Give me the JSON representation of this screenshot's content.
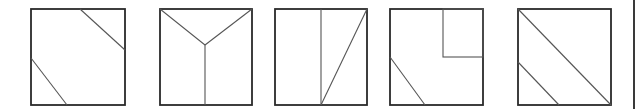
{
  "figure": {
    "stroke_color": "#2a2a2a",
    "inner_stroke_color": "#555555",
    "background": "#ffffff"
  },
  "squares": [
    {
      "id": "square-1",
      "frame": {
        "x": 31,
        "y": 9,
        "w": 94,
        "h": 96
      },
      "lines": [
        {
          "x1": 80,
          "y1": 9,
          "x2": 125,
          "y2": 50
        },
        {
          "x1": 31,
          "y1": 58,
          "x2": 67,
          "y2": 105
        }
      ],
      "rects": []
    },
    {
      "id": "square-2",
      "frame": {
        "x": 160,
        "y": 9,
        "w": 92,
        "h": 96
      },
      "lines": [
        {
          "x1": 160,
          "y1": 9,
          "x2": 205,
          "y2": 45
        },
        {
          "x1": 252,
          "y1": 9,
          "x2": 205,
          "y2": 45
        },
        {
          "x1": 205,
          "y1": 45,
          "x2": 205,
          "y2": 105
        }
      ],
      "rects": []
    },
    {
      "id": "square-3",
      "frame": {
        "x": 275,
        "y": 9,
        "w": 92,
        "h": 96
      },
      "lines": [
        {
          "x1": 321,
          "y1": 9,
          "x2": 321,
          "y2": 105
        },
        {
          "x1": 367,
          "y1": 9,
          "x2": 321,
          "y2": 105
        }
      ],
      "rects": []
    },
    {
      "id": "square-4",
      "frame": {
        "x": 390,
        "y": 9,
        "w": 93,
        "h": 96
      },
      "lines": [
        {
          "x1": 390,
          "y1": 57,
          "x2": 425,
          "y2": 105
        }
      ],
      "rects": [
        {
          "x": 443,
          "y": 9,
          "w": 40,
          "h": 48
        }
      ]
    },
    {
      "id": "square-5",
      "frame": {
        "x": 518,
        "y": 9,
        "w": 93,
        "h": 96
      },
      "lines": [
        {
          "x1": 518,
          "y1": 9,
          "x2": 611,
          "y2": 105
        },
        {
          "x1": 518,
          "y1": 62,
          "x2": 559,
          "y2": 105
        }
      ],
      "rects": []
    }
  ],
  "edge_bar": {
    "x": 634,
    "y1": 0,
    "y2": 109
  }
}
